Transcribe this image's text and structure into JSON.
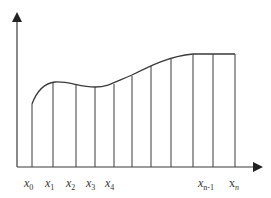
{
  "diagram": {
    "colors": {
      "line": "#3a3a3a",
      "background": "#ffffff"
    },
    "partition_labels": [
      {
        "base": "x",
        "sub": "0",
        "x": 24
      },
      {
        "base": "x",
        "sub": "1",
        "x": 45
      },
      {
        "base": "x",
        "sub": "2",
        "x": 66
      },
      {
        "base": "x",
        "sub": "3",
        "x": 86
      },
      {
        "base": "x",
        "sub": "4",
        "x": 105
      },
      {
        "base": "x",
        "sub": "n-1",
        "x": 199
      },
      {
        "base": "x",
        "sub": "n",
        "x": 229
      }
    ]
  }
}
